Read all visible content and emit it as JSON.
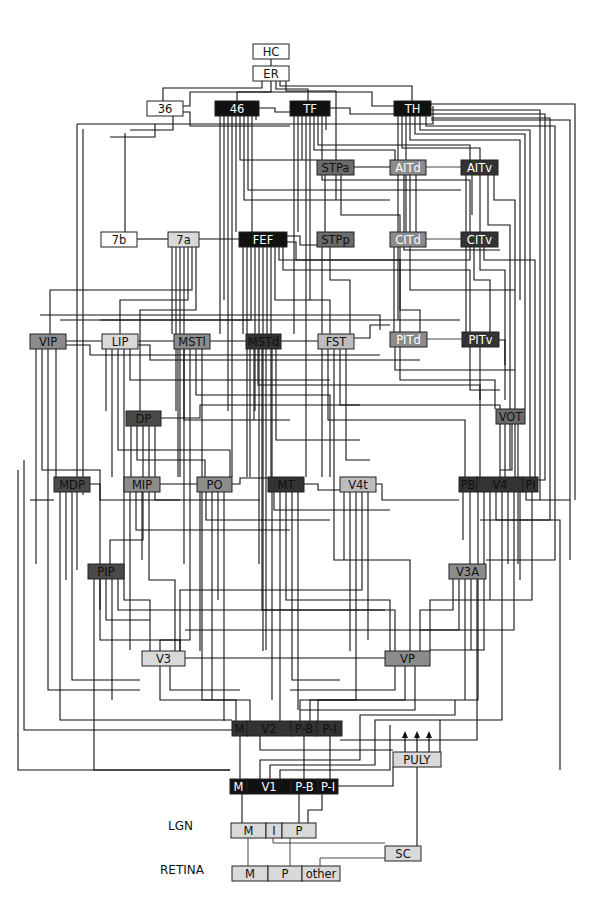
{
  "diagram": {
    "colors": {
      "white": "#ffffff",
      "light": "#d9d9d9",
      "midlight": "#bdbdbd",
      "mid": "#8c8c8c",
      "middark": "#6b6b6b",
      "dark": "#4a4a4a",
      "darker": "#333333",
      "black": "#111111"
    },
    "side_labels": [
      {
        "id": "lgn_label",
        "text": "LGN",
        "x": 168,
        "y": 830
      },
      {
        "id": "retina_label",
        "text": "RETINA",
        "x": 160,
        "y": 874
      }
    ],
    "nodes": [
      {
        "id": "HC",
        "label": "HC",
        "x": 253,
        "y": 44,
        "w": 36,
        "h": 15,
        "fill": "white",
        "text": "#111"
      },
      {
        "id": "ER",
        "label": "ER",
        "x": 253,
        "y": 66,
        "w": 36,
        "h": 15,
        "fill": "white",
        "text": "#111"
      },
      {
        "id": "36",
        "label": "36",
        "x": 147,
        "y": 101,
        "w": 36,
        "h": 15,
        "fill": "white",
        "text": "#111"
      },
      {
        "id": "46",
        "label": "46",
        "x": 215,
        "y": 101,
        "w": 44,
        "h": 15,
        "fill": "black",
        "text": "#fff"
      },
      {
        "id": "TF",
        "label": "TF",
        "x": 290,
        "y": 101,
        "w": 40,
        "h": 15,
        "fill": "black",
        "text": "#fff"
      },
      {
        "id": "TH",
        "label": "TH",
        "x": 394,
        "y": 101,
        "w": 37,
        "h": 15,
        "fill": "black",
        "text": "#fff"
      },
      {
        "id": "STPa",
        "label": "STPa",
        "x": 317,
        "y": 160,
        "w": 37,
        "h": 15,
        "fill": "middark",
        "text": "#111"
      },
      {
        "id": "AITd",
        "label": "AITd",
        "x": 390,
        "y": 160,
        "w": 36,
        "h": 15,
        "fill": "mid",
        "text": "#fff"
      },
      {
        "id": "AITv",
        "label": "AITv",
        "x": 461,
        "y": 160,
        "w": 37,
        "h": 15,
        "fill": "darker",
        "text": "#fff"
      },
      {
        "id": "7b",
        "label": "7b",
        "x": 101,
        "y": 232,
        "w": 36,
        "h": 15,
        "fill": "white",
        "text": "#111"
      },
      {
        "id": "7a",
        "label": "7a",
        "x": 168,
        "y": 232,
        "w": 31,
        "h": 15,
        "fill": "light",
        "text": "#111"
      },
      {
        "id": "FEF",
        "label": "FEF",
        "x": 239,
        "y": 232,
        "w": 48,
        "h": 15,
        "fill": "black",
        "text": "#fff"
      },
      {
        "id": "STPp",
        "label": "STPp",
        "x": 317,
        "y": 232,
        "w": 37,
        "h": 15,
        "fill": "middark",
        "text": "#111"
      },
      {
        "id": "CITd",
        "label": "CITd",
        "x": 390,
        "y": 232,
        "w": 36,
        "h": 15,
        "fill": "mid",
        "text": "#fff"
      },
      {
        "id": "CITv",
        "label": "CITv",
        "x": 461,
        "y": 232,
        "w": 37,
        "h": 15,
        "fill": "darker",
        "text": "#fff"
      },
      {
        "id": "VIP",
        "label": "VIP",
        "x": 30,
        "y": 334,
        "w": 36,
        "h": 15,
        "fill": "mid",
        "text": "#111"
      },
      {
        "id": "LIP",
        "label": "LIP",
        "x": 102,
        "y": 334,
        "w": 36,
        "h": 15,
        "fill": "light",
        "text": "#111"
      },
      {
        "id": "MSTl",
        "label": "MSTl",
        "x": 174,
        "y": 334,
        "w": 36,
        "h": 15,
        "fill": "mid",
        "text": "#111"
      },
      {
        "id": "MSTd",
        "label": "MSTd",
        "x": 246,
        "y": 334,
        "w": 35,
        "h": 15,
        "fill": "darker",
        "text": "#111"
      },
      {
        "id": "FST",
        "label": "FST",
        "x": 318,
        "y": 334,
        "w": 36,
        "h": 15,
        "fill": "midlight",
        "text": "#111"
      },
      {
        "id": "PITd",
        "label": "PITd",
        "x": 390,
        "y": 332,
        "w": 37,
        "h": 15,
        "fill": "mid",
        "text": "#fff"
      },
      {
        "id": "PITv",
        "label": "PITv",
        "x": 462,
        "y": 332,
        "w": 37,
        "h": 15,
        "fill": "darker",
        "text": "#fff"
      },
      {
        "id": "DP",
        "label": "DP",
        "x": 126,
        "y": 411,
        "w": 35,
        "h": 15,
        "fill": "dark",
        "text": "#111"
      },
      {
        "id": "VOT",
        "label": "VOT",
        "x": 496,
        "y": 409,
        "w": 29,
        "h": 15,
        "fill": "middark",
        "text": "#111"
      },
      {
        "id": "MDP",
        "label": "MDP",
        "x": 54,
        "y": 477,
        "w": 36,
        "h": 15,
        "fill": "dark",
        "text": "#111"
      },
      {
        "id": "MIP",
        "label": "MIP",
        "x": 124,
        "y": 477,
        "w": 36,
        "h": 15,
        "fill": "mid",
        "text": "#111"
      },
      {
        "id": "PO",
        "label": "PO",
        "x": 197,
        "y": 477,
        "w": 35,
        "h": 15,
        "fill": "mid",
        "text": "#111"
      },
      {
        "id": "MT",
        "label": "MT",
        "x": 268,
        "y": 477,
        "w": 36,
        "h": 15,
        "fill": "darker",
        "text": "#111"
      },
      {
        "id": "V4t",
        "label": "V4t",
        "x": 340,
        "y": 477,
        "w": 36,
        "h": 15,
        "fill": "midlight",
        "text": "#111"
      },
      {
        "id": "PB",
        "label": "PB",
        "x": 459,
        "y": 477,
        "w": 18,
        "h": 15,
        "fill": "darker",
        "text": "#111"
      },
      {
        "id": "V4",
        "label": "V4",
        "x": 477,
        "y": 477,
        "w": 46,
        "h": 15,
        "fill": "darker",
        "text": "#111"
      },
      {
        "id": "PI",
        "label": "PI",
        "x": 523,
        "y": 477,
        "w": 15,
        "h": 15,
        "fill": "darker",
        "text": "#111"
      },
      {
        "id": "PIP",
        "label": "PIP",
        "x": 88,
        "y": 564,
        "w": 36,
        "h": 15,
        "fill": "dark",
        "text": "#111"
      },
      {
        "id": "V3A",
        "label": "V3A",
        "x": 449,
        "y": 564,
        "w": 37,
        "h": 15,
        "fill": "mid",
        "text": "#111"
      },
      {
        "id": "V3",
        "label": "V3",
        "x": 142,
        "y": 651,
        "w": 43,
        "h": 15,
        "fill": "light",
        "text": "#111"
      },
      {
        "id": "VP",
        "label": "VP",
        "x": 385,
        "y": 651,
        "w": 45,
        "h": 15,
        "fill": "mid",
        "text": "#111"
      },
      {
        "id": "V2M",
        "label": "M",
        "x": 232,
        "y": 721,
        "w": 15,
        "h": 15,
        "fill": "darker",
        "text": "#111"
      },
      {
        "id": "V2",
        "label": "V2",
        "x": 247,
        "y": 721,
        "w": 44,
        "h": 15,
        "fill": "darker",
        "text": "#111"
      },
      {
        "id": "V2PB",
        "label": "P-B",
        "x": 291,
        "y": 721,
        "w": 26,
        "h": 15,
        "fill": "darker",
        "text": "#111"
      },
      {
        "id": "V2PI",
        "label": "P-I",
        "x": 317,
        "y": 721,
        "w": 25,
        "h": 15,
        "fill": "darker",
        "text": "#111"
      },
      {
        "id": "PULY",
        "label": "PULY",
        "x": 393,
        "y": 752,
        "w": 48,
        "h": 15,
        "fill": "light",
        "text": "#111"
      },
      {
        "id": "V1M",
        "label": "M",
        "x": 230,
        "y": 779,
        "w": 17,
        "h": 15,
        "fill": "black",
        "text": "#fff"
      },
      {
        "id": "V1",
        "label": "V1",
        "x": 247,
        "y": 779,
        "w": 44,
        "h": 15,
        "fill": "black",
        "text": "#fff"
      },
      {
        "id": "V1PB",
        "label": "P-B",
        "x": 291,
        "y": 779,
        "w": 27,
        "h": 15,
        "fill": "black",
        "text": "#fff"
      },
      {
        "id": "V1PI",
        "label": "P-I",
        "x": 318,
        "y": 779,
        "w": 20,
        "h": 15,
        "fill": "black",
        "text": "#fff"
      },
      {
        "id": "LGNM",
        "label": "M",
        "x": 231,
        "y": 823,
        "w": 35,
        "h": 15,
        "fill": "light",
        "text": "#111"
      },
      {
        "id": "LGNI",
        "label": "I",
        "x": 266,
        "y": 823,
        "w": 16,
        "h": 15,
        "fill": "light",
        "text": "#111"
      },
      {
        "id": "LGNP",
        "label": "P",
        "x": 282,
        "y": 823,
        "w": 34,
        "h": 15,
        "fill": "light",
        "text": "#111"
      },
      {
        "id": "SC",
        "label": "SC",
        "x": 385,
        "y": 846,
        "w": 36,
        "h": 15,
        "fill": "light",
        "text": "#111"
      },
      {
        "id": "RETM",
        "label": "M",
        "x": 232,
        "y": 866,
        "w": 36,
        "h": 15,
        "fill": "light",
        "text": "#111"
      },
      {
        "id": "RETP",
        "label": "P",
        "x": 268,
        "y": 866,
        "w": 34,
        "h": 15,
        "fill": "light",
        "text": "#111"
      },
      {
        "id": "RETother",
        "label": "other",
        "x": 302,
        "y": 866,
        "w": 38,
        "h": 15,
        "fill": "light",
        "text": "#111"
      }
    ],
    "puly_arrows": [
      405,
      417,
      429
    ]
  }
}
